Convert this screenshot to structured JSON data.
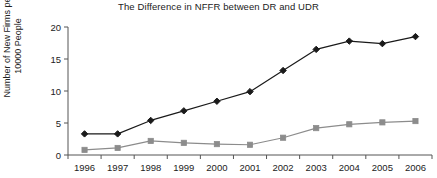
{
  "chart_data": {
    "type": "line",
    "title": "The Difference in NFFR between DR and UDR",
    "xlabel": "",
    "ylabel": "Number of New Firms per 10000 People",
    "ylabel_lines": [
      "Number of New Firms per",
      "10000 People"
    ],
    "categories": [
      "1996",
      "1997",
      "1998",
      "1999",
      "2000",
      "2001",
      "2002",
      "2003",
      "2004",
      "2005",
      "2006"
    ],
    "ylim": [
      0,
      20
    ],
    "yticks": [
      "0",
      "5",
      "10",
      "15",
      "20"
    ],
    "ytick_values": [
      0,
      5,
      10,
      15,
      20
    ],
    "grid": false,
    "legend": "none",
    "series": [
      {
        "name": "DR",
        "marker": "diamond",
        "color": "#1a1a1a",
        "values": [
          3.3,
          3.3,
          5.4,
          6.9,
          8.4,
          9.9,
          13.2,
          16.5,
          17.8,
          17.4,
          18.5
        ]
      },
      {
        "name": "UDR",
        "marker": "square",
        "color": "#8c8c8c",
        "values": [
          0.8,
          1.1,
          2.2,
          1.9,
          1.7,
          1.6,
          2.7,
          4.2,
          4.8,
          5.1,
          5.3
        ]
      }
    ]
  },
  "axis": {
    "line_color": "#555555"
  }
}
